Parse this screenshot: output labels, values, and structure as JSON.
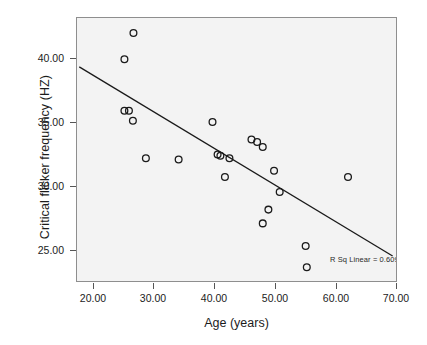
{
  "chart_data": {
    "type": "scatter",
    "title": "",
    "xlabel": "Age (years)",
    "ylabel": "Critical flicker frequency (HZ)",
    "xlim": [
      16.8,
      73.3
    ],
    "ylim": [
      22.3,
      43.3
    ],
    "xticks": [
      20.0,
      30.0,
      40.0,
      50.0,
      60.0,
      70.0
    ],
    "xticklabels": [
      "20.00",
      "30.00",
      "40.00",
      "50.00",
      "60.00",
      "70.00"
    ],
    "yticks": [
      25.0,
      30.0,
      35.0,
      40.0
    ],
    "yticklabels": [
      "25.00",
      "30.00",
      "35.00",
      "40.00"
    ],
    "grid": false,
    "legend": null,
    "marker": "open-circle",
    "marker_color": "#1a1a1a",
    "plot_background": "#f3f3f3",
    "points": [
      {
        "x": 26.8,
        "y": 42.1
      },
      {
        "x": 25.2,
        "y": 40.0
      },
      {
        "x": 25.2,
        "y": 35.9
      },
      {
        "x": 26.0,
        "y": 35.9
      },
      {
        "x": 26.7,
        "y": 35.1
      },
      {
        "x": 29.0,
        "y": 32.1
      },
      {
        "x": 34.8,
        "y": 32.0
      },
      {
        "x": 40.8,
        "y": 35.0
      },
      {
        "x": 41.7,
        "y": 32.4
      },
      {
        "x": 42.2,
        "y": 32.3
      },
      {
        "x": 43.8,
        "y": 32.1
      },
      {
        "x": 43.0,
        "y": 30.6
      },
      {
        "x": 47.7,
        "y": 33.6
      },
      {
        "x": 48.7,
        "y": 33.4
      },
      {
        "x": 49.7,
        "y": 33.0
      },
      {
        "x": 51.7,
        "y": 31.1
      },
      {
        "x": 52.7,
        "y": 29.4
      },
      {
        "x": 50.7,
        "y": 28.0
      },
      {
        "x": 49.7,
        "y": 26.9
      },
      {
        "x": 57.3,
        "y": 25.1
      },
      {
        "x": 57.5,
        "y": 23.4
      },
      {
        "x": 64.8,
        "y": 30.6
      }
    ],
    "trendline": {
      "type": "linear-fit",
      "x_start": 17.2,
      "y_start": 39.4,
      "x_end": 72.7,
      "y_end": 24.3,
      "color": "#1a1a1a"
    },
    "annotations": [
      {
        "name": "r-squared",
        "text": "R Sq Linear = 0.609"
      }
    ]
  }
}
